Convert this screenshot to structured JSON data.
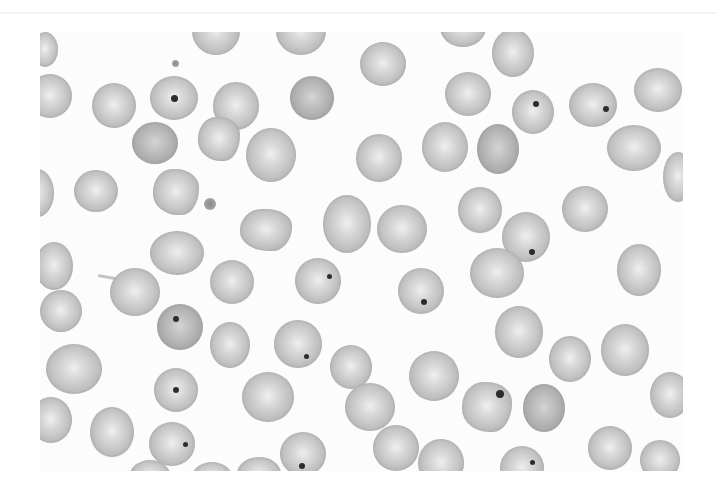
{
  "image": {
    "subject": "blood-smear-micrograph",
    "description": "Grayscale micrograph of red blood cells, several with small dark inclusion bodies",
    "frame": {
      "x": 40,
      "y": 32,
      "w": 643,
      "h": 439
    },
    "background": "#fcfcfc"
  },
  "cells": [
    {
      "x": -8,
      "y": 0,
      "w": 26,
      "h": 35,
      "type": "normal"
    },
    {
      "x": 152,
      "y": -25,
      "w": 48,
      "h": 48,
      "type": "normal"
    },
    {
      "x": 236,
      "y": -25,
      "w": 50,
      "h": 48,
      "type": "normal"
    },
    {
      "x": 400,
      "y": -25,
      "w": 46,
      "h": 40,
      "type": "normal"
    },
    {
      "x": 320,
      "y": 10,
      "w": 46,
      "h": 44,
      "type": "normal"
    },
    {
      "x": 452,
      "y": -3,
      "w": 42,
      "h": 48,
      "type": "normal"
    },
    {
      "x": -12,
      "y": 42,
      "w": 44,
      "h": 44,
      "type": "normal"
    },
    {
      "x": 52,
      "y": 51,
      "w": 44,
      "h": 45,
      "type": "normal"
    },
    {
      "x": 110,
      "y": 44,
      "w": 48,
      "h": 44,
      "type": "normal",
      "dot": {
        "x": 24,
        "y": 22,
        "s": 7
      }
    },
    {
      "x": 173,
      "y": 50,
      "w": 46,
      "h": 48,
      "type": "normal"
    },
    {
      "x": 250,
      "y": 44,
      "w": 44,
      "h": 44,
      "type": "dark"
    },
    {
      "x": 405,
      "y": 40,
      "w": 46,
      "h": 44,
      "type": "normal"
    },
    {
      "x": 472,
      "y": 58,
      "w": 42,
      "h": 44,
      "type": "normal",
      "dot": {
        "x": 24,
        "y": 14,
        "s": 6
      }
    },
    {
      "x": 529,
      "y": 51,
      "w": 48,
      "h": 44,
      "type": "normal",
      "dot": {
        "x": 37,
        "y": 26,
        "s": 6
      }
    },
    {
      "x": 594,
      "y": 36,
      "w": 48,
      "h": 44,
      "type": "normal"
    },
    {
      "x": 92,
      "y": 90,
      "w": 46,
      "h": 42,
      "type": "dark"
    },
    {
      "x": 158,
      "y": 85,
      "w": 42,
      "h": 44,
      "type": "crenated"
    },
    {
      "x": 206,
      "y": 96,
      "w": 50,
      "h": 54,
      "type": "normal"
    },
    {
      "x": 316,
      "y": 102,
      "w": 46,
      "h": 48,
      "type": "normal"
    },
    {
      "x": 382,
      "y": 90,
      "w": 46,
      "h": 50,
      "type": "normal"
    },
    {
      "x": 437,
      "y": 92,
      "w": 42,
      "h": 50,
      "type": "dark"
    },
    {
      "x": 567,
      "y": 93,
      "w": 54,
      "h": 46,
      "type": "normal"
    },
    {
      "x": 623,
      "y": 120,
      "w": 30,
      "h": 50,
      "type": "normal"
    },
    {
      "x": -20,
      "y": 137,
      "w": 34,
      "h": 48,
      "type": "normal"
    },
    {
      "x": 34,
      "y": 138,
      "w": 44,
      "h": 42,
      "type": "normal"
    },
    {
      "x": 113,
      "y": 137,
      "w": 46,
      "h": 46,
      "type": "crenated"
    },
    {
      "x": 418,
      "y": 155,
      "w": 44,
      "h": 46,
      "type": "normal"
    },
    {
      "x": 522,
      "y": 154,
      "w": 46,
      "h": 46,
      "type": "normal"
    },
    {
      "x": 283,
      "y": 163,
      "w": 48,
      "h": 58,
      "type": "normal"
    },
    {
      "x": 337,
      "y": 173,
      "w": 50,
      "h": 48,
      "type": "normal"
    },
    {
      "x": 200,
      "y": 177,
      "w": 52,
      "h": 42,
      "type": "crenated"
    },
    {
      "x": 462,
      "y": 180,
      "w": 48,
      "h": 50,
      "type": "normal",
      "dot": {
        "x": 30,
        "y": 40,
        "s": 6
      }
    },
    {
      "x": 110,
      "y": 199,
      "w": 54,
      "h": 44,
      "type": "normal"
    },
    {
      "x": -5,
      "y": 210,
      "w": 38,
      "h": 48,
      "type": "normal"
    },
    {
      "x": 577,
      "y": 212,
      "w": 44,
      "h": 52,
      "type": "normal"
    },
    {
      "x": 170,
      "y": 228,
      "w": 44,
      "h": 44,
      "type": "normal"
    },
    {
      "x": 255,
      "y": 226,
      "w": 46,
      "h": 46,
      "type": "normal",
      "dot": {
        "x": 34,
        "y": 18,
        "s": 5
      }
    },
    {
      "x": 430,
      "y": 216,
      "w": 54,
      "h": 50,
      "type": "normal"
    },
    {
      "x": 70,
      "y": 236,
      "w": 50,
      "h": 48,
      "type": "normal"
    },
    {
      "x": 358,
      "y": 236,
      "w": 46,
      "h": 46,
      "type": "normal",
      "dot": {
        "x": 26,
        "y": 34,
        "s": 6
      }
    },
    {
      "x": 0,
      "y": 258,
      "w": 42,
      "h": 42,
      "type": "normal"
    },
    {
      "x": 117,
      "y": 272,
      "w": 46,
      "h": 46,
      "type": "dark",
      "dot": {
        "x": 19,
        "y": 15,
        "s": 6
      }
    },
    {
      "x": 170,
      "y": 290,
      "w": 40,
      "h": 46,
      "type": "normal"
    },
    {
      "x": 234,
      "y": 288,
      "w": 48,
      "h": 48,
      "type": "normal",
      "dot": {
        "x": 32,
        "y": 36,
        "s": 5
      }
    },
    {
      "x": 455,
      "y": 274,
      "w": 48,
      "h": 52,
      "type": "normal"
    },
    {
      "x": 509,
      "y": 304,
      "w": 42,
      "h": 46,
      "type": "normal"
    },
    {
      "x": 561,
      "y": 292,
      "w": 48,
      "h": 52,
      "type": "normal"
    },
    {
      "x": 6,
      "y": 312,
      "w": 56,
      "h": 50,
      "type": "normal"
    },
    {
      "x": 290,
      "y": 313,
      "w": 42,
      "h": 44,
      "type": "normal"
    },
    {
      "x": 369,
      "y": 319,
      "w": 50,
      "h": 50,
      "type": "normal"
    },
    {
      "x": 114,
      "y": 336,
      "w": 44,
      "h": 44,
      "type": "normal",
      "dot": {
        "x": 22,
        "y": 22,
        "s": 6
      }
    },
    {
      "x": 202,
      "y": 340,
      "w": 52,
      "h": 50,
      "type": "normal"
    },
    {
      "x": 610,
      "y": 340,
      "w": 40,
      "h": 46,
      "type": "normal"
    },
    {
      "x": 305,
      "y": 351,
      "w": 50,
      "h": 48,
      "type": "normal"
    },
    {
      "x": 422,
      "y": 350,
      "w": 50,
      "h": 50,
      "type": "crenated",
      "dot": {
        "x": 38,
        "y": 12,
        "s": 8
      }
    },
    {
      "x": 483,
      "y": 352,
      "w": 42,
      "h": 48,
      "type": "dark"
    },
    {
      "x": -10,
      "y": 365,
      "w": 42,
      "h": 46,
      "type": "normal"
    },
    {
      "x": 50,
      "y": 375,
      "w": 44,
      "h": 50,
      "type": "normal"
    },
    {
      "x": 109,
      "y": 390,
      "w": 46,
      "h": 44,
      "type": "normal",
      "dot": {
        "x": 36,
        "y": 22,
        "s": 5
      }
    },
    {
      "x": 240,
      "y": 400,
      "w": 46,
      "h": 44,
      "type": "normal",
      "dot": {
        "x": 22,
        "y": 34,
        "s": 6
      }
    },
    {
      "x": 333,
      "y": 393,
      "w": 46,
      "h": 46,
      "type": "normal"
    },
    {
      "x": 378,
      "y": 407,
      "w": 46,
      "h": 48,
      "type": "normal"
    },
    {
      "x": 548,
      "y": 394,
      "w": 44,
      "h": 44,
      "type": "normal"
    },
    {
      "x": 600,
      "y": 408,
      "w": 40,
      "h": 40,
      "type": "normal"
    },
    {
      "x": 90,
      "y": 428,
      "w": 40,
      "h": 30,
      "type": "normal"
    },
    {
      "x": 152,
      "y": 430,
      "w": 40,
      "h": 30,
      "type": "normal"
    },
    {
      "x": 197,
      "y": 425,
      "w": 44,
      "h": 34,
      "type": "normal"
    },
    {
      "x": 460,
      "y": 414,
      "w": 44,
      "h": 44,
      "type": "normal",
      "dot": {
        "x": 32,
        "y": 16,
        "s": 5
      }
    },
    {
      "x": 538,
      "y": 440,
      "w": 44,
      "h": 36,
      "type": "normal"
    },
    {
      "x": 612,
      "y": 440,
      "w": 24,
      "h": 36,
      "type": "normal"
    }
  ],
  "fragments": [
    {
      "x": 132,
      "y": 28,
      "s": 7
    },
    {
      "x": 164,
      "y": 166,
      "s": 12
    }
  ],
  "tails": [
    {
      "x": 58,
      "y": 242,
      "len": 30,
      "angle": 10
    }
  ]
}
